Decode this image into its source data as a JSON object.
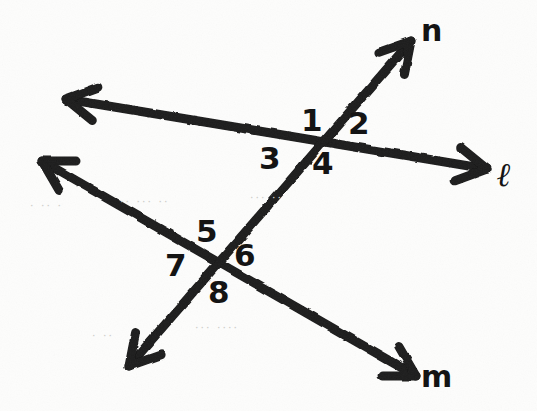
{
  "figure": {
    "background_color": "#fdfdfc",
    "ink_color": "#1a1a1a",
    "stroke_width": 9
  },
  "lines": [
    {
      "id": "line-ell",
      "label": "ℓ",
      "label_x": 497,
      "label_y": 158,
      "from_x": 66,
      "from_y": 99,
      "to_x": 487,
      "to_y": 169,
      "arrow_start": true,
      "arrow_end": true
    },
    {
      "id": "line-n",
      "label": "n",
      "label_x": 421,
      "label_y": 16,
      "from_x": 411,
      "from_y": 41,
      "to_x": 129,
      "to_y": 366,
      "arrow_start": true,
      "arrow_end": true
    },
    {
      "id": "line-m",
      "label": "m",
      "label_x": 421,
      "label_y": 362,
      "from_x": 42,
      "from_y": 161,
      "to_x": 416,
      "to_y": 376,
      "arrow_start": true,
      "arrow_end": true
    }
  ],
  "intersections": [
    {
      "id": "intersection-upper",
      "x": 325,
      "y": 143,
      "lines": [
        "line-ell",
        "line-n"
      ]
    },
    {
      "id": "intersection-lower",
      "x": 212,
      "y": 265,
      "lines": [
        "line-m",
        "line-n"
      ]
    }
  ],
  "angle_labels": [
    {
      "id": "angle-1",
      "text": "1",
      "x": 301,
      "y": 105,
      "intersection": "intersection-upper"
    },
    {
      "id": "angle-2",
      "text": "2",
      "x": 348,
      "y": 108,
      "intersection": "intersection-upper"
    },
    {
      "id": "angle-3",
      "text": "3",
      "x": 259,
      "y": 143,
      "intersection": "intersection-upper"
    },
    {
      "id": "angle-4",
      "text": "4",
      "x": 312,
      "y": 148,
      "intersection": "intersection-upper"
    },
    {
      "id": "angle-5",
      "text": "5",
      "x": 196,
      "y": 216,
      "intersection": "intersection-lower"
    },
    {
      "id": "angle-6",
      "text": "6",
      "x": 234,
      "y": 240,
      "intersection": "intersection-lower"
    },
    {
      "id": "angle-7",
      "text": "7",
      "x": 165,
      "y": 250,
      "intersection": "intersection-lower"
    },
    {
      "id": "angle-8",
      "text": "8",
      "x": 208,
      "y": 277,
      "intersection": "intersection-lower"
    }
  ],
  "ghost_marks": [
    {
      "id": "ghost-1",
      "text": "· ·· ·",
      "x": 30,
      "y": 200
    },
    {
      "id": "ghost-2",
      "text": "·· ··· ··",
      "x": 120,
      "y": 196
    },
    {
      "id": "ghost-3",
      "text": "··· ··",
      "x": 250,
      "y": 192
    },
    {
      "id": "ghost-4",
      "text": "··· ····",
      "x": 195,
      "y": 322
    },
    {
      "id": "ghost-5",
      "text": "· ··",
      "x": 92,
      "y": 330
    }
  ]
}
